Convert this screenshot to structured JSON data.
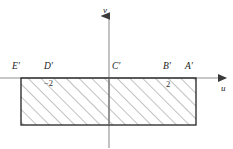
{
  "figure": {
    "axes": {
      "horizontal_label": "u",
      "vertical_label": "v",
      "horizontal_axis_y": 78,
      "vertical_axis_x": 109
    },
    "tick_labels": [
      {
        "text": "−2",
        "axis": "u",
        "value": -2
      },
      {
        "text": "2",
        "axis": "u",
        "value": 2
      }
    ],
    "points": [
      {
        "label": "E′",
        "u": -4,
        "v": 0
      },
      {
        "label": "D′",
        "u": -2,
        "v": 0
      },
      {
        "label": "C′",
        "u": 0,
        "v": 0
      },
      {
        "label": "B′",
        "u": 2,
        "v": 0
      },
      {
        "label": "A′",
        "u": 4,
        "v": 0
      }
    ],
    "region": {
      "shape": "rectangle",
      "fill": "hatched",
      "hatch_angle_deg": 45,
      "hatch_color": "#808080",
      "border_color": "#000000",
      "u_range": [
        -4,
        4
      ],
      "v_range": [
        -3,
        0
      ]
    },
    "colors": {
      "axis": "#8a8a8a",
      "outline": "#1a1a1a",
      "hatch": "#8c8c8c",
      "background": "#ffffff"
    }
  }
}
